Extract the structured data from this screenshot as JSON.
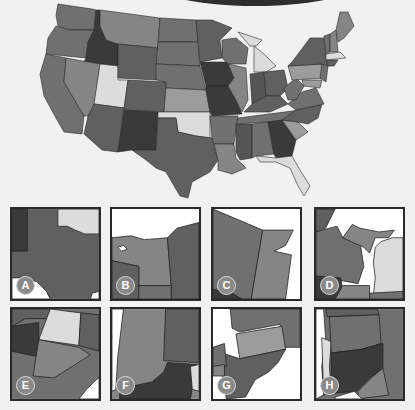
{
  "colors": {
    "background": "#f1f1f1",
    "banner": "#2e2e2e",
    "darkest": "#3a3a3a",
    "dark": "#555555",
    "mid": "#6e6e6e",
    "midlight": "#858585",
    "light": "#9c9c9c",
    "pale": "#dcdcdc",
    "water": "#ffffff",
    "border": "#2a2a2a",
    "badge": "#8a8a8a"
  },
  "map": {
    "name": "Contiguous United States",
    "shaded_states": {
      "darkest": [
        "Idaho",
        "New Mexico",
        "Iowa",
        "Missouri",
        "Georgia"
      ],
      "pale": [
        "Utah",
        "Oklahoma",
        "Michigan",
        "Florida",
        "Massachusetts"
      ]
    }
  },
  "panels": [
    {
      "label": "A",
      "region": "Texas"
    },
    {
      "label": "B",
      "region": "Minnesota / Great Lakes shore"
    },
    {
      "label": "C",
      "region": "Maine / New Hampshire"
    },
    {
      "label": "D",
      "region": "Wisconsin and Michigan"
    },
    {
      "label": "E",
      "region": "Utah, Colorado, Arizona, New Mexico"
    },
    {
      "label": "F",
      "region": "Indiana / Kentucky"
    },
    {
      "label": "G",
      "region": "Pennsylvania / Virginia"
    },
    {
      "label": "H",
      "region": "Ohio / West Virginia"
    }
  ]
}
